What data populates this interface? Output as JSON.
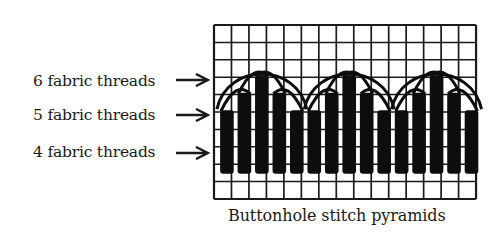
{
  "labels": [
    {
      "text": "6 fabric threads",
      "top": 72,
      "arrow_y": 79
    },
    {
      "text": "5 fabric threads",
      "top": 106,
      "arrow_y": 114
    },
    {
      "text": "4 fabric threads",
      "top": 144,
      "arrow_y": 152
    }
  ],
  "caption": "Buttonhole stitch pyramids",
  "grid": {
    "x": 214,
    "y": 25,
    "cols": 15,
    "rows": 10,
    "cell_w": 17.47,
    "cell_h": 17.4,
    "line_color": "#1a1a1a"
  },
  "stitch": {
    "color": "#0d0d0d",
    "base_row": 8.55,
    "pyramids": [
      {
        "start_col": 0.35,
        "heights": [
          4,
          5,
          6,
          5,
          4
        ]
      },
      {
        "start_col": 5.35,
        "heights": [
          4,
          5,
          6,
          5,
          4
        ]
      },
      {
        "start_col": 10.35,
        "heights": [
          4,
          5,
          6,
          5,
          4
        ]
      }
    ]
  }
}
